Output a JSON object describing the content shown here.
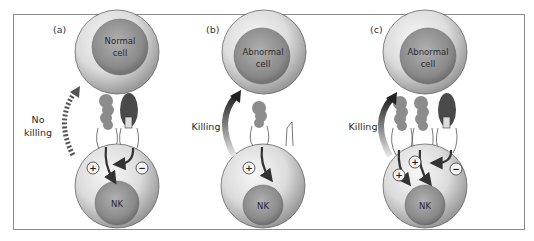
{
  "figure": {
    "panels": [
      {
        "id": "a",
        "label": "(a)",
        "target_cell": "Normal",
        "target_cell_line2": "cell",
        "effector_cell": "NK",
        "outcome_line1": "No",
        "outcome_line2": "killing",
        "signals": [
          "+",
          "−"
        ]
      },
      {
        "id": "b",
        "label": "(b)",
        "target_cell": "Abnormal",
        "target_cell_line2": "cell",
        "effector_cell": "NK",
        "outcome_line1": "Killing",
        "signals": [
          "+"
        ]
      },
      {
        "id": "c",
        "label": "(c)",
        "target_cell": "Abnormal",
        "target_cell_line2": "cell",
        "effector_cell": "NK",
        "outcome_line1": "Killing",
        "signals": [
          "+",
          "+",
          "−"
        ]
      }
    ],
    "colors": {
      "cell_outer": "#d9d9d9",
      "nucleus": "#8f8f8f",
      "activating_ligand": "#8c8c8c",
      "inhibitory_ligand": "#4a4a4a",
      "arrow": "#3a3a3a",
      "frame": "#8a8a8a"
    }
  }
}
